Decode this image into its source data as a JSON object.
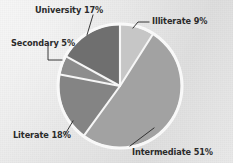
{
  "chart_data": {
    "type": "pie",
    "title": "",
    "categories": [
      "Illiterate",
      "Intermediate",
      "Literate",
      "Secondary",
      "University"
    ],
    "values": [
      9,
      51,
      18,
      5,
      17
    ],
    "unit": "%",
    "legend_position": "callout-labels",
    "grid": false,
    "labels": {
      "illiterate": "Illiterate 9%",
      "intermediate": "Intermediate 51%",
      "literate": "Literate 18%",
      "secondary": "Secondary 5%",
      "university": "University 17%"
    },
    "colors": {
      "illiterate": "#c6c6c6",
      "intermediate": "#a2a2a2",
      "literate": "#848484",
      "secondary": "#8d8d8d",
      "university": "#6f6f6f",
      "separator": "#f4f4f4",
      "background": "#e9e9e9",
      "label_text": "#2b2b2b",
      "leader_line": "#1f1f1f"
    }
  }
}
